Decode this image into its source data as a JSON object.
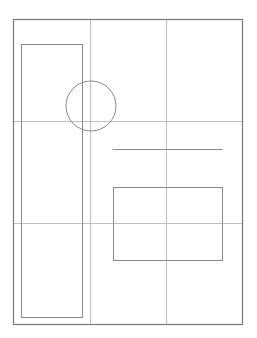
{
  "diagram": {
    "type": "layout-wireframe",
    "canvas": {
      "width": 257,
      "height": 338,
      "background": "#ffffff"
    },
    "colors": {
      "frame": "#777777",
      "grid": "#b0b0b0",
      "shape": "#8a8a8a"
    },
    "page_frame": {
      "x": 13.5,
      "y": 19.5,
      "width": 229,
      "height": 305
    },
    "grid": {
      "description": "rule-of-thirds guides",
      "vertical_lines_x": [
        90.5,
        166.5
      ],
      "horizontal_lines_y": [
        121.5,
        223.5
      ]
    },
    "shapes": [
      {
        "kind": "rect",
        "name": "tall-column-placeholder",
        "x": 21.5,
        "y": 44.5,
        "width": 61,
        "height": 273
      },
      {
        "kind": "circle",
        "name": "circle-placeholder",
        "cx": 91,
        "cy": 106,
        "r": 25
      },
      {
        "kind": "line",
        "name": "text-line-placeholder",
        "x1": 112.5,
        "y1": 149.5,
        "x2": 222.5,
        "y2": 149.5
      },
      {
        "kind": "rect",
        "name": "image-box-placeholder",
        "x": 113.5,
        "y": 187.5,
        "width": 109,
        "height": 73
      }
    ]
  }
}
